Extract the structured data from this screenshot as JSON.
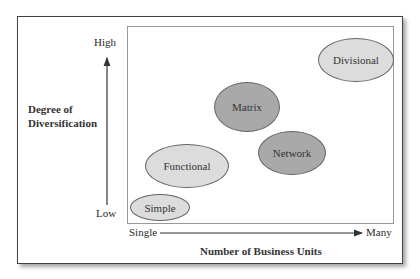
{
  "diagram": {
    "y_axis": {
      "label_line1": "Degree of",
      "label_line2": "Diversification",
      "high": "High",
      "low": "Low"
    },
    "x_axis": {
      "label": "Number of Business Units",
      "start": "Single",
      "end": "Many"
    },
    "structures": [
      {
        "name": "Simple",
        "shade": "light"
      },
      {
        "name": "Functional",
        "shade": "light"
      },
      {
        "name": "Matrix",
        "shade": "dark"
      },
      {
        "name": "Network",
        "shade": "dark"
      },
      {
        "name": "Divisional",
        "shade": "light"
      }
    ],
    "colors": {
      "light_fill": "#dcdcdc",
      "dark_fill": "#a9a9a9",
      "border": "#444444"
    }
  }
}
